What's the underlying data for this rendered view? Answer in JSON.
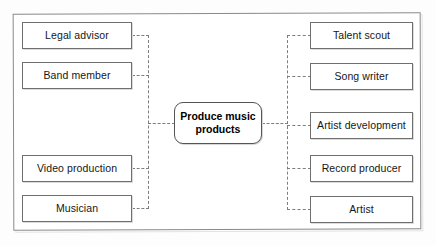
{
  "diagram": {
    "type": "mind-map",
    "title": "Produce music products",
    "center": {
      "label": "Produce music products"
    },
    "left_nodes": [
      {
        "label": "Legal advisor"
      },
      {
        "label": "Band member"
      },
      {
        "label": "Video production"
      },
      {
        "label": "Musician"
      }
    ],
    "right_nodes": [
      {
        "label": "Talent scout"
      },
      {
        "label": "Song writer"
      },
      {
        "label": "Artist development"
      },
      {
        "label": "Record producer"
      },
      {
        "label": "Artist"
      }
    ],
    "colors": {
      "box_border": "#6f6f6f",
      "center_border": "#555555",
      "connector": "#7d7d7d",
      "frame_border": "#8a8a8a",
      "background": "#ffffff",
      "text": "#161616"
    }
  }
}
